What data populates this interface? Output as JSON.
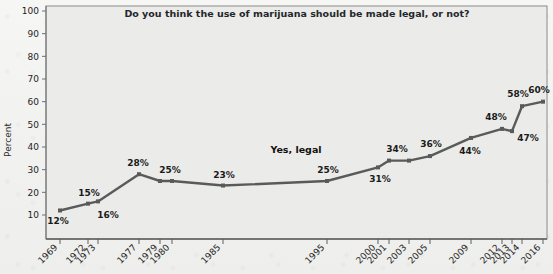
{
  "chart_data": {
    "type": "line",
    "title": "Do you think the use of marijuana should be made legal, or not?",
    "xlabel": "",
    "ylabel": "Percent",
    "ylim": [
      0,
      100
    ],
    "yticks": [
      10,
      20,
      30,
      40,
      50,
      60,
      70,
      80,
      90,
      100
    ],
    "grid": false,
    "legend_position": "inline-annotation",
    "annotations": [
      "Yes, legal"
    ],
    "categories": [
      "1969",
      "1972",
      "1973",
      "1977",
      "1979",
      "1980",
      "1985",
      "1995",
      "2000",
      "2001",
      "2003",
      "2005",
      "2009",
      "2012",
      "2013",
      "2014",
      "2016"
    ],
    "series": [
      {
        "name": "Yes, legal",
        "values": [
          12,
          15,
          16,
          28,
          25,
          25,
          23,
          25,
          31,
          34,
          34,
          36,
          44,
          48,
          47,
          58,
          60
        ],
        "point_labels": [
          "12%",
          "15%",
          "16%",
          "28%",
          "25%",
          "",
          "23%",
          "25%",
          "31%",
          "34%",
          "",
          "36%",
          "44%",
          "48%",
          "47%",
          "58%",
          "60%"
        ],
        "color": "#5a5a5a"
      }
    ]
  },
  "chart": {
    "title": "Do you think the use of marijuana should be made legal, or not?",
    "y_axis_title": "Percent",
    "series_annotation": "Yes, legal",
    "y_ticks": [
      "100",
      "90",
      "80",
      "70",
      "60",
      "50",
      "40",
      "30",
      "20",
      "10"
    ],
    "x_ticks": [
      "1969",
      "1972",
      "1973",
      "1977",
      "1979",
      "1980",
      "1985",
      "1995",
      "2000",
      "2001",
      "2003",
      "2005",
      "2009",
      "2012",
      "2013",
      "2014",
      "2016"
    ],
    "data_labels": [
      "12%",
      "15%",
      "16%",
      "28%",
      "25%",
      "23%",
      "25%",
      "31%",
      "34%",
      "36%",
      "44%",
      "48%",
      "47%",
      "58%",
      "60%"
    ],
    "colors": {
      "line": "#5a5a5a",
      "plot_background": "#ebebe9",
      "page_background": "#f2f2f0",
      "text": "#1f1f1f"
    }
  }
}
